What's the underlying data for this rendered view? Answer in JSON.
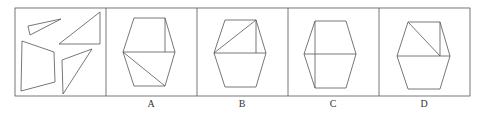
{
  "puzzle": {
    "stem_panel": {
      "description": "four separate pieces: two triangles and a quadrilateral, plus a right triangle",
      "pieces": [
        "small-triangle",
        "right-triangle",
        "quadrilateral",
        "triangle"
      ]
    },
    "options": [
      {
        "label": "A",
        "description": "hexagon split by horizontal center line; vertical line in upper right; diagonal in lower half"
      },
      {
        "label": "B",
        "description": "hexagon split by horizontal center line; vertical line and diagonal in upper half"
      },
      {
        "label": "C",
        "description": "hexagon split by horizontal center line and vertical line"
      },
      {
        "label": "D",
        "description": "hexagon split by horizontal center line; diagonal and vertical line in upper half from top-left"
      }
    ]
  },
  "colors": {
    "line": "#555555",
    "background": "#ffffff"
  }
}
